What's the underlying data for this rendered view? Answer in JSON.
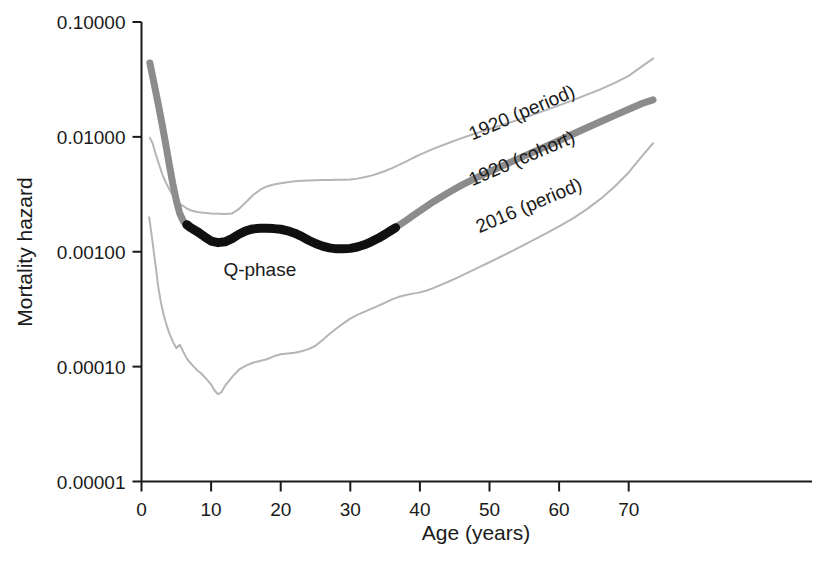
{
  "chart_data": {
    "type": "line",
    "title": "",
    "xlabel": "Age (years)",
    "ylabel": "Mortality hazard",
    "xlim": [
      0,
      74
    ],
    "ylim": [
      1e-05,
      0.1
    ],
    "yscale": "log",
    "grid": false,
    "legend_position": "inline-curve-labels",
    "xticks": [
      0,
      10,
      20,
      30,
      40,
      50,
      60,
      70
    ],
    "xtick_labels": [
      "0",
      "10",
      "20",
      "30",
      "40",
      "50",
      "60",
      "70"
    ],
    "yticks": [
      0.1,
      0.01,
      0.001,
      0.0001,
      1e-05
    ],
    "ytick_labels": [
      "0.10000",
      "0.01000",
      "0.00100",
      "0.00010",
      "0.00001"
    ],
    "annotations": [
      {
        "text": "Q-phase",
        "x": 17,
        "y": 0.00062,
        "rotation": 0
      }
    ],
    "series": [
      {
        "name": "1920 (period)",
        "color": "#b5b5b5",
        "width": 2,
        "label_x": 55,
        "label_y": 0.0145,
        "label_rotation": -23,
        "x": [
          1.2,
          1.6,
          2,
          2.5,
          3,
          3.5,
          4,
          4.5,
          5,
          5.5,
          6,
          6.5,
          7,
          8,
          9,
          10,
          11,
          12,
          13,
          14,
          15,
          16,
          17,
          18,
          19,
          20,
          21,
          22,
          23,
          24,
          25,
          26,
          27,
          28,
          29,
          30,
          31,
          32,
          33,
          34,
          35,
          36,
          37,
          38,
          39,
          40,
          42,
          44,
          46,
          48,
          50,
          52,
          54,
          56,
          58,
          60,
          62,
          64,
          66,
          68,
          70,
          72,
          73.5
        ],
        "y": [
          0.0098,
          0.0088,
          0.0072,
          0.0058,
          0.0047,
          0.004,
          0.0035,
          0.0031,
          0.0028,
          0.0026,
          0.0025,
          0.00238,
          0.0023,
          0.00222,
          0.00218,
          0.00215,
          0.00214,
          0.00213,
          0.00215,
          0.00236,
          0.0027,
          0.0031,
          0.00345,
          0.0037,
          0.00385,
          0.00395,
          0.00403,
          0.0041,
          0.00415,
          0.00418,
          0.0042,
          0.00421,
          0.00422,
          0.00423,
          0.00424,
          0.00426,
          0.00433,
          0.00445,
          0.0046,
          0.0048,
          0.00505,
          0.00535,
          0.0057,
          0.0061,
          0.00655,
          0.007,
          0.0079,
          0.0088,
          0.00975,
          0.0107,
          0.0117,
          0.0128,
          0.014,
          0.0154,
          0.017,
          0.0188,
          0.0209,
          0.0233,
          0.026,
          0.0295,
          0.034,
          0.0415,
          0.048
        ]
      },
      {
        "name": "1920 (cohort)",
        "color": "#8c8c8c",
        "width": 7,
        "label_x": 55,
        "label_y": 0.0058,
        "label_rotation": -23,
        "x": [
          1.2,
          1.5,
          2,
          2.5,
          3,
          3.5,
          4,
          4.5,
          5,
          5.5,
          6,
          6.5,
          7,
          8,
          9,
          10,
          11,
          12,
          13,
          14,
          15,
          16,
          17,
          18,
          19,
          20,
          21,
          22,
          23,
          24,
          25,
          26,
          27,
          28,
          29,
          30,
          31,
          32,
          33,
          34,
          35,
          36,
          37,
          38,
          39,
          40,
          42,
          44,
          46,
          48,
          50,
          52,
          54,
          56,
          58,
          60,
          62,
          64,
          66,
          68,
          70,
          72,
          73.5
        ],
        "y": [
          0.044,
          0.036,
          0.0255,
          0.018,
          0.0125,
          0.0085,
          0.0057,
          0.0039,
          0.0028,
          0.00215,
          0.00185,
          0.00172,
          0.00163,
          0.0015,
          0.00136,
          0.00124,
          0.0012,
          0.00122,
          0.0013,
          0.00142,
          0.00152,
          0.00158,
          0.0016,
          0.0016,
          0.00159,
          0.00157,
          0.00152,
          0.00145,
          0.00136,
          0.00126,
          0.00118,
          0.00112,
          0.00108,
          0.00106,
          0.00106,
          0.00107,
          0.0011,
          0.00115,
          0.00122,
          0.00131,
          0.00142,
          0.00155,
          0.0017,
          0.00187,
          0.00206,
          0.00227,
          0.00274,
          0.00325,
          0.0038,
          0.00437,
          0.00497,
          0.00565,
          0.0064,
          0.00725,
          0.0082,
          0.0093,
          0.0106,
          0.012,
          0.0136,
          0.0154,
          0.0174,
          0.0196,
          0.021
        ]
      },
      {
        "name": "2016 (period)",
        "color": "#b5b5b5",
        "width": 2,
        "label_x": 56,
        "label_y": 0.00225,
        "label_rotation": -23,
        "x": [
          1.1,
          1.3,
          1.6,
          2,
          2.4,
          2.8,
          3.2,
          3.6,
          4,
          4.5,
          5,
          5.5,
          6,
          6.5,
          7,
          7.5,
          8,
          8.5,
          9,
          9.5,
          10,
          10.5,
          11,
          11.5,
          12,
          13,
          14,
          15,
          16,
          17,
          18,
          19,
          20,
          21,
          22,
          23,
          24,
          25,
          26,
          27,
          28,
          29,
          30,
          31,
          32,
          33,
          34,
          35,
          36,
          37,
          38,
          39,
          40,
          41,
          42,
          43,
          44,
          45,
          46,
          48,
          50,
          52,
          54,
          56,
          58,
          60,
          62,
          64,
          66,
          68,
          70,
          72,
          73.5
        ],
        "y": [
          0.002,
          0.00163,
          0.0012,
          0.00078,
          0.0005,
          0.00036,
          0.00028,
          0.00023,
          0.000195,
          0.000165,
          0.000145,
          0.000155,
          0.000135,
          0.000118,
          0.000108,
          0.0001,
          9.3e-05,
          8.8e-05,
          8.2e-05,
          7.6e-05,
          7e-05,
          6.2e-05,
          5.75e-05,
          6e-05,
          6.8e-05,
          8.1e-05,
          9.4e-05,
          0.000102,
          0.000108,
          0.000112,
          0.000116,
          0.000123,
          0.000128,
          0.00013,
          0.000132,
          0.000136,
          0.000142,
          0.000152,
          0.00017,
          0.000192,
          0.000215,
          0.000238,
          0.000262,
          0.000282,
          0.0003,
          0.000318,
          0.000338,
          0.00036,
          0.000385,
          0.000405,
          0.00042,
          0.000432,
          0.000443,
          0.00046,
          0.000485,
          0.000515,
          0.000545,
          0.00058,
          0.00062,
          0.00071,
          0.00081,
          0.00093,
          0.00107,
          0.00124,
          0.00143,
          0.00166,
          0.00195,
          0.00235,
          0.0029,
          0.0037,
          0.0049,
          0.0069,
          0.0088
        ]
      },
      {
        "name": "Q-phase (highlight)",
        "color": "#101010",
        "width": 9,
        "parent": "1920 (cohort)",
        "x_start": 6.5,
        "x_end": 36.5,
        "x": [
          6.5,
          7,
          8,
          9,
          10,
          11,
          12,
          13,
          14,
          15,
          16,
          17,
          18,
          19,
          20,
          21,
          22,
          23,
          24,
          25,
          26,
          27,
          28,
          29,
          30,
          31,
          32,
          33,
          34,
          35,
          36,
          36.5
        ],
        "y": [
          0.00172,
          0.00163,
          0.0015,
          0.00136,
          0.00124,
          0.0012,
          0.00122,
          0.0013,
          0.00142,
          0.00152,
          0.00158,
          0.0016,
          0.0016,
          0.00159,
          0.00157,
          0.00152,
          0.00145,
          0.00136,
          0.00126,
          0.00118,
          0.00112,
          0.00108,
          0.00106,
          0.00106,
          0.00107,
          0.0011,
          0.00115,
          0.00122,
          0.00131,
          0.00142,
          0.00155,
          0.00162
        ]
      }
    ]
  },
  "axis": {
    "color": "#1a1a1a"
  }
}
